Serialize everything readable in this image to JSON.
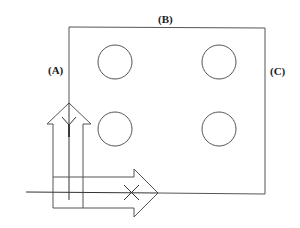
{
  "diagram": {
    "labels": {
      "a": "(A)",
      "b": "(B)",
      "c": "(C)"
    },
    "plate": {
      "x": 69,
      "y": 28,
      "width": 196,
      "height": 166
    },
    "holes": [
      {
        "cx": 115,
        "cy": 62,
        "r": 17
      },
      {
        "cx": 219,
        "cy": 62,
        "r": 17
      },
      {
        "cx": 115,
        "cy": 129,
        "r": 17
      },
      {
        "cx": 219,
        "cy": 129,
        "r": 17
      }
    ],
    "arrows": {
      "vertical": {
        "direction": "up",
        "tail_symbol": "feather-y"
      },
      "horizontal": {
        "direction": "right",
        "tail_symbol": "cross-x"
      }
    },
    "colors": {
      "line": "#555555",
      "text": "#1a1a1a",
      "background": "#ffffff"
    }
  }
}
